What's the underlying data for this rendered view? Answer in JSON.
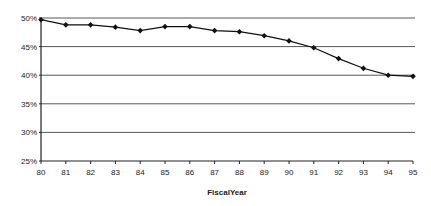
{
  "chart_data": {
    "type": "line",
    "title": "",
    "xlabel": "FiscalYear",
    "ylabel": "",
    "categories": [
      "80",
      "81",
      "82",
      "83",
      "84",
      "85",
      "86",
      "87",
      "88",
      "89",
      "90",
      "91",
      "92",
      "93",
      "94",
      "95"
    ],
    "series": [
      {
        "name": "Series 1",
        "values": [
          49.7,
          48.8,
          48.8,
          48.4,
          47.8,
          48.5,
          48.5,
          47.8,
          47.6,
          46.9,
          46.0,
          44.8,
          42.9,
          41.2,
          40.0,
          39.8
        ],
        "color": "#111111",
        "marker": "diamond"
      }
    ],
    "yticks": [
      "25%",
      "30%",
      "35%",
      "40%",
      "45%",
      "50%"
    ],
    "ytick_values": [
      25,
      30,
      35,
      40,
      45,
      50
    ],
    "ylim": [
      25,
      50
    ],
    "grid": true,
    "legend": "none"
  }
}
